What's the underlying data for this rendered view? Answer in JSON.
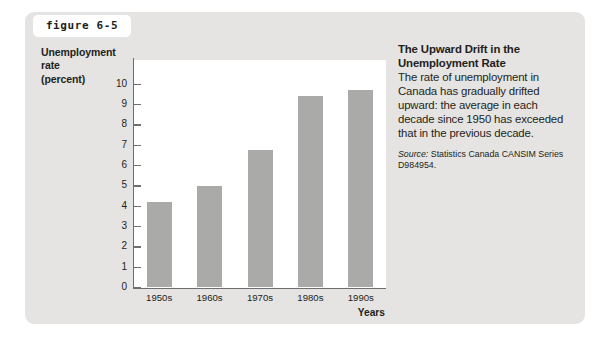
{
  "figure": {
    "tab_label": "figure 6-5",
    "panel_color": "#e5e4e2",
    "bar_color": "#aaaaa8",
    "axis_color": "#6d6e70"
  },
  "chart_data": {
    "type": "bar",
    "title": "",
    "categories": [
      "1950s",
      "1960s",
      "1970s",
      "1980s",
      "1990s"
    ],
    "values": [
      4.2,
      5.0,
      6.75,
      9.4,
      9.7
    ],
    "xlabel": "Years",
    "ylabel": "Unemployment rate (percent)",
    "ylabel_lines": [
      "Unemployment",
      "rate",
      "(percent)"
    ],
    "ylim": [
      0,
      10
    ],
    "ytick_labels": [
      "10",
      "9",
      "8",
      "7",
      "6",
      "5",
      "4",
      "3",
      "2",
      "1",
      "0"
    ],
    "ytick_values": [
      10,
      9,
      8,
      7,
      6,
      5,
      4,
      3,
      2,
      1,
      0
    ],
    "grid": false,
    "legend": "none"
  },
  "note": {
    "title": "The Upward Drift in the Unemployment Rate",
    "body": "The rate of unemployment in Canada has gradually drifted upward: the average in each decade since 1950 has exceeded that in the previous decade.",
    "source_label": "Source:",
    "source_text": " Statistics Canada CANSIM Series D984954."
  }
}
